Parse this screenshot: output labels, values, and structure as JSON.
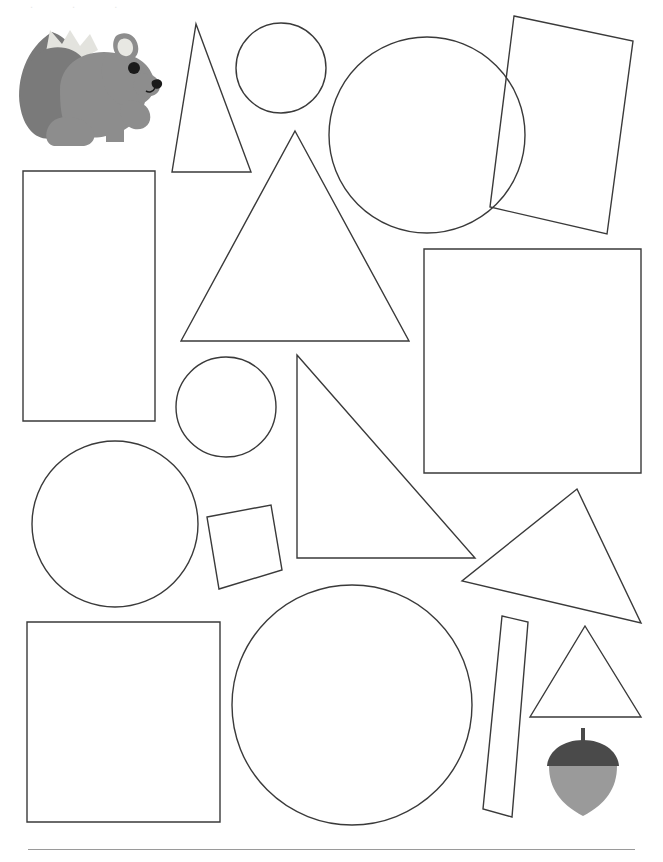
{
  "page": {
    "width": 663,
    "height": 862,
    "background_color": "#ffffff",
    "outline_color": "#3a3a3a",
    "outline_width": 1.4,
    "footer_rule_color": "#9a9a9a",
    "top_text_residue": ". , ."
  },
  "clipart": {
    "squirrel": {
      "name": "squirrel",
      "colors": {
        "body": "#8d8d8d",
        "tail": "#7a7a7a",
        "tail_tip": "#e3e3de",
        "ear_inner": "#e8e8e3",
        "eye": "#1a1a1a",
        "nose": "#1a1a1a"
      }
    },
    "acorn": {
      "name": "acorn",
      "colors": {
        "cap": "#4a4a4a",
        "body": "#9a9a9a",
        "stem": "#4a4a4a"
      }
    }
  },
  "shapes": [
    {
      "id": "triangle-tall-top-left",
      "type": "triangle",
      "label": "Tall Triangle",
      "points": "196,24 251,172 172,172"
    },
    {
      "id": "circle-small-top",
      "type": "circle",
      "label": "Small Circle",
      "cx": 281,
      "cy": 68,
      "r": 45
    },
    {
      "id": "circle-large-top-right",
      "type": "circle",
      "label": "Large Circle",
      "cx": 427,
      "cy": 135,
      "r": 98
    },
    {
      "id": "rectangle-tilted-top-right",
      "type": "rectangle",
      "label": "Tilted Rectangle",
      "points": "514,16 633,41 607,234 490,207"
    },
    {
      "id": "rectangle-left-upper",
      "type": "rectangle",
      "label": "Upright Rectangle",
      "points": "23,171 155,171 155,421 23,421"
    },
    {
      "id": "triangle-large-center",
      "type": "triangle",
      "label": "Large Triangle",
      "points": "295,131 409,341 181,341"
    },
    {
      "id": "square-right-center",
      "type": "square",
      "label": "Large Square",
      "points": "424,249 641,249 641,473 424,473"
    },
    {
      "id": "circle-small-center-left",
      "type": "circle",
      "label": "Small Circle",
      "cx": 226,
      "cy": 407,
      "r": 50
    },
    {
      "id": "triangle-right-angle-center",
      "type": "triangle",
      "label": "Right Triangle",
      "points": "297,355 475,558 297,558"
    },
    {
      "id": "circle-medium-left",
      "type": "circle",
      "label": "Medium Circle",
      "cx": 115,
      "cy": 524,
      "r": 83
    },
    {
      "id": "square-small-tilted",
      "type": "square",
      "label": "Small Tilted Square",
      "points": "207,517 271,505 282,570 219,589"
    },
    {
      "id": "triangle-obtuse-right",
      "type": "triangle",
      "label": "Obtuse Triangle",
      "points": "577,489 641,623 462,581"
    },
    {
      "id": "circle-large-bottom-center",
      "type": "circle",
      "label": "Large Circle",
      "cx": 352,
      "cy": 705,
      "r": 120
    },
    {
      "id": "rectangle-narrow-strip",
      "type": "rectangle",
      "label": "Narrow Strip",
      "points": "502,616 528,622 512,817 483,809"
    },
    {
      "id": "triangle-small-bottom-right",
      "type": "triangle",
      "label": "Small Triangle",
      "points": "585,626 641,717 530,717"
    },
    {
      "id": "square-bottom-left",
      "type": "square",
      "label": "Large Square",
      "points": "27,622 220,622 220,822 27,822"
    }
  ]
}
